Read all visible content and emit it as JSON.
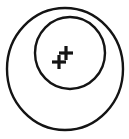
{
  "figure": {
    "background_color": "#ffffff",
    "stroke_color": "#141414",
    "canvas": {
      "width": 129,
      "height": 139
    },
    "outer_circle": {
      "name": "outer-circle",
      "cx": 65,
      "cy": 69,
      "rx": 58,
      "ry": 61,
      "stroke_width": 2.4
    },
    "inner_circle": {
      "name": "inner-circle",
      "cx": 70,
      "cy": 53,
      "rx": 35,
      "ry": 36,
      "stroke_width": 2.4
    },
    "marks": [
      {
        "name": "plus-mark-upper-right",
        "symbol": "+",
        "cx": 66,
        "cy": 53,
        "arm": 7,
        "stroke_width": 3.2
      },
      {
        "name": "plus-mark-lower-left",
        "symbol": "+",
        "cx": 59,
        "cy": 62,
        "arm": 7,
        "stroke_width": 3.2
      }
    ]
  }
}
